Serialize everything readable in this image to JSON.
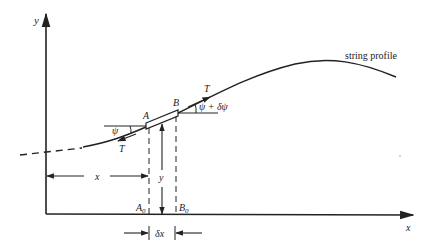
{
  "diagram": {
    "type": "string element force diagram",
    "colors": {
      "ink": "#222222",
      "background": "#ffffff"
    },
    "axes": {
      "x_label": "x",
      "y_label": "y",
      "origin": [
        46,
        214
      ]
    },
    "curve": {
      "label": "string profile",
      "dashed_extension": true
    },
    "points": {
      "A": "A",
      "B": "B",
      "A0": "A",
      "A0_sub": "0",
      "B0": "B",
      "B0_sub": "0"
    },
    "forces": {
      "tension_left": "T",
      "tension_right": "T"
    },
    "angles": {
      "left": "ψ",
      "right": "ψ + δψ"
    },
    "dimensions": {
      "horizontal_position": "x",
      "vertical_displacement": "y",
      "element_width": "δx"
    }
  }
}
